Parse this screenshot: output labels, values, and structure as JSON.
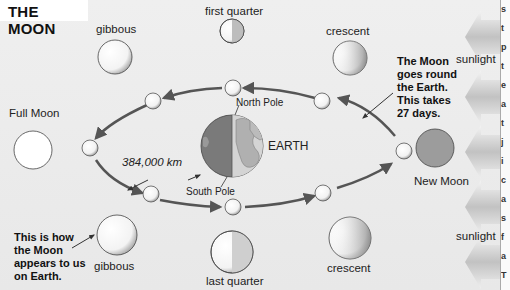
{
  "title": "THE MOON",
  "earth": {
    "label": "EARTH",
    "north": "North Pole",
    "south": "South Pole"
  },
  "distance": "384,000 km",
  "phases": {
    "top_left": "gibbous",
    "top_center": "first quarter",
    "top_right": "crescent",
    "left": "Full Moon",
    "right": "New Moon",
    "bottom_left": "gibbous",
    "bottom_center": "last quarter",
    "bottom_right": "crescent"
  },
  "notes": {
    "orbit": "The Moon\ngoes round\nthe Earth.\nThis takes\n27 days.",
    "appearance": "This is how\nthe Moon\nappears to us\non Earth."
  },
  "sunlight": {
    "top": "sunlight",
    "bottom": "sunlight"
  },
  "colors": {
    "background": "#ececec",
    "arrow": "#555555",
    "new_moon": "#999999",
    "sunlight_arrow": "#c8c8c8"
  },
  "side_text": [
    "s",
    "t",
    "p",
    "t",
    "e",
    "a",
    "t",
    "j",
    "i",
    "c",
    "a",
    "s",
    "f",
    "a",
    "T",
    "e",
    "c"
  ]
}
